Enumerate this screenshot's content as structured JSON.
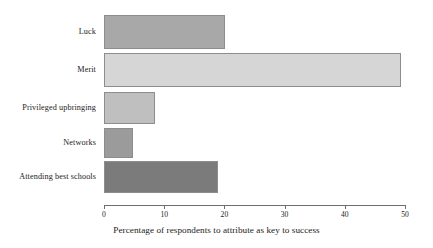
{
  "chart_data": {
    "type": "bar",
    "orientation": "horizontal",
    "title": "",
    "xlabel": "Percentage of respondents to attribute as key to success",
    "ylabel": "",
    "xlim": [
      0,
      50
    ],
    "xticks": [
      "0",
      "10",
      "20",
      "30",
      "40",
      "50"
    ],
    "grid": false,
    "legend": "none",
    "categories": [
      "Luck",
      "Merit",
      "Privileged upbringing",
      "Networks",
      "Attending best schools"
    ],
    "values": [
      20.1,
      49.3,
      8.5,
      4.8,
      19.0
    ],
    "bar_colors": [
      "#a8a8a8",
      "#d6d6d6",
      "#bfbfbf",
      "#9b9b9b",
      "#7b7b7b"
    ],
    "bars": [
      {
        "label": "Luck",
        "value": 20.1,
        "color": "#a8a8a8"
      },
      {
        "label": "Merit",
        "value": 49.3,
        "color": "#d6d6d6"
      },
      {
        "label": "Privileged upbringing",
        "value": 8.5,
        "color": "#bfbfbf"
      },
      {
        "label": "Networks",
        "value": 4.8,
        "color": "#9b9b9b"
      },
      {
        "label": "Attending best schools",
        "value": 19.0,
        "color": "#7b7b7b"
      }
    ],
    "axis_color": "#6e6e6e"
  }
}
